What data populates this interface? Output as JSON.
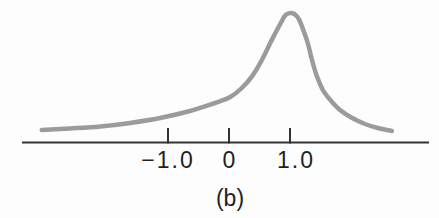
{
  "figure": {
    "caption": "(b)",
    "background": "#fdfdfd"
  },
  "chart_data": {
    "type": "line",
    "title": "",
    "xlabel": "",
    "ylabel": "",
    "xlim": [
      -3.4,
      3.3
    ],
    "grid": false,
    "legend": "none",
    "peak_x": 1.0,
    "x_ticks": [
      {
        "value": -1.0,
        "label": "−1.0"
      },
      {
        "value": 0,
        "label": "0"
      },
      {
        "value": 1.0,
        "label": "1.0"
      }
    ],
    "curve_color": "#9b9b9b",
    "axis_color": "#333333",
    "text_color": "#1f1f1f",
    "series": [
      {
        "name": "density-curve",
        "y_units": "relative height (0-1, peak = 1)",
        "points": [
          [
            -3.07,
            0.096
          ],
          [
            -2.61,
            0.108
          ],
          [
            -2.11,
            0.124
          ],
          [
            -1.62,
            0.151
          ],
          [
            -1.13,
            0.189
          ],
          [
            -0.64,
            0.243
          ],
          [
            -0.23,
            0.305
          ],
          [
            0.02,
            0.351
          ],
          [
            0.21,
            0.421
          ],
          [
            0.38,
            0.513
          ],
          [
            0.54,
            0.637
          ],
          [
            0.7,
            0.791
          ],
          [
            0.84,
            0.915
          ],
          [
            0.93,
            0.985
          ],
          [
            1.03,
            1.0
          ],
          [
            1.11,
            0.977
          ],
          [
            1.16,
            0.938
          ],
          [
            1.23,
            0.853
          ],
          [
            1.3,
            0.753
          ],
          [
            1.36,
            0.637
          ],
          [
            1.44,
            0.513
          ],
          [
            1.54,
            0.405
          ],
          [
            1.66,
            0.328
          ],
          [
            1.82,
            0.251
          ],
          [
            2.02,
            0.189
          ],
          [
            2.23,
            0.143
          ],
          [
            2.44,
            0.112
          ],
          [
            2.67,
            0.089
          ]
        ]
      }
    ]
  }
}
